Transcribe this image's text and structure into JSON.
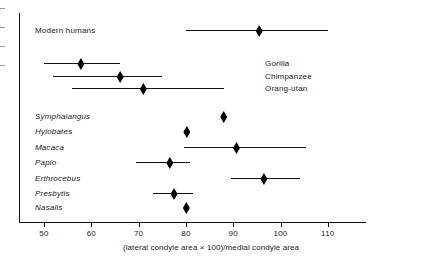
{
  "chart_data": {
    "type": "scatter",
    "title": "",
    "xlabel": "(lateral condyle area × 100)/medial condyle area",
    "ylabel": "",
    "xlim": [
      45,
      118
    ],
    "xticks": [
      50,
      60,
      70,
      80,
      90,
      100,
      110
    ],
    "xtick_labels": [
      "50",
      "60",
      "70",
      "80",
      "90",
      "100",
      "110"
    ],
    "grid": false,
    "legend": "none",
    "orientation": "horizontal-range-plot",
    "series": [
      {
        "name": "Modern humans",
        "label_style": "roman",
        "label_position": "left",
        "mean": 95.5,
        "low": 80,
        "high": 110,
        "has_range": true
      },
      {
        "name": "Gorilla",
        "label_style": "roman",
        "label_position": "right",
        "mean": 57.8,
        "low": 50,
        "high": 66,
        "has_range": true
      },
      {
        "name": "Chimpanzee",
        "label_style": "roman",
        "label_position": "right",
        "mean": 66.1,
        "low": 52,
        "high": 75,
        "has_range": true
      },
      {
        "name": "Orang-utan",
        "label_style": "roman",
        "label_position": "right",
        "mean": 71.0,
        "low": 56,
        "high": 88,
        "has_range": true
      },
      {
        "name": "Symphalangus",
        "label_style": "italic",
        "label_position": "left",
        "mean": 88.0,
        "low": 88.0,
        "high": 88.0,
        "has_range": false
      },
      {
        "name": "Hylobates",
        "label_style": "italic",
        "label_position": "left",
        "mean": 80.2,
        "low": 80.2,
        "high": 80.2,
        "has_range": false
      },
      {
        "name": "Macaca",
        "label_style": "italic",
        "label_position": "left",
        "mean": 90.7,
        "low": 79.6,
        "high": 105.3,
        "has_range": true
      },
      {
        "name": "Papio",
        "label_style": "italic",
        "label_position": "left",
        "mean": 76.6,
        "low": 69.5,
        "high": 80.9,
        "has_range": true
      },
      {
        "name": "Erthrocebus",
        "label_style": "italic",
        "label_position": "left",
        "mean": 96.5,
        "low": 89.5,
        "high": 104.1,
        "has_range": true
      },
      {
        "name": "Presbytis",
        "label_style": "italic",
        "label_position": "left",
        "mean": 77.5,
        "low": 73.1,
        "high": 81.6,
        "has_range": true
      },
      {
        "name": "Nasalis",
        "label_style": "italic",
        "label_position": "left",
        "mean": 80.1,
        "low": 80.1,
        "high": 80.1,
        "has_range": false
      }
    ]
  },
  "colors": {
    "marker": "#000000",
    "line": "#111111",
    "axis": "#111111",
    "text": "#1a1a1a",
    "background": "#ffffff"
  }
}
